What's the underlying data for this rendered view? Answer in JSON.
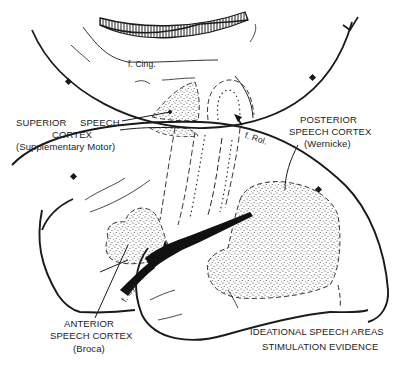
{
  "diagram": {
    "labels": {
      "cingulate_fissure": "f. Cing.",
      "rolandic_fissure": "f. Rol.",
      "sylvian_fissure": "f. Sylv.",
      "superior_line1a": "SUPERIOR",
      "superior_line1b": "SPEECH",
      "superior_line2": "CORTEX",
      "superior_line3": "(Supplementary Motor)",
      "posterior_line1": "POSTERIOR",
      "posterior_line2": "SPEECH CORTEX",
      "posterior_line3": "(Wernicke)",
      "anterior_line1": "ANTERIOR",
      "anterior_line2": "SPEECH CORTEX",
      "anterior_line3": "(Broca)",
      "caption_line1": "IDEATIONAL SPEECH AREAS",
      "caption_line2": "STIMULATION EVIDENCE"
    },
    "regions": [
      {
        "name": "Superior speech cortex",
        "subtitle": "Supplementary Motor",
        "fill": "stippled"
      },
      {
        "name": "Posterior speech cortex",
        "subtitle": "Wernicke",
        "fill": "stippled"
      },
      {
        "name": "Anterior speech cortex",
        "subtitle": "Broca",
        "fill": "stippled"
      }
    ],
    "colors": {
      "ink": "#1a1a1a",
      "paper": "#ffffff"
    }
  }
}
